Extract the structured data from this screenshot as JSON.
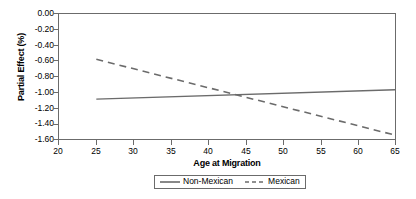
{
  "chart_data": {
    "type": "line",
    "title": "",
    "xlabel": "Age at Migration",
    "ylabel": "Partial Effect (%)",
    "xlim": [
      20,
      65
    ],
    "ylim": [
      -1.6,
      0.0
    ],
    "xticks": [
      "20",
      "25",
      "30",
      "35",
      "40",
      "45",
      "50",
      "55",
      "60",
      "65"
    ],
    "yticks": [
      "0.00",
      "-0.20",
      "-0.40",
      "-0.60",
      "-0.80",
      "-1.00",
      "-1.20",
      "-1.40",
      "-1.60"
    ],
    "grid": false,
    "legend_position": "bottom",
    "x": [
      25,
      65
    ],
    "series": [
      {
        "name": "Non-Mexican",
        "style": "solid",
        "color": "#6b6b6b",
        "values": [
          -1.09,
          -0.97
        ]
      },
      {
        "name": "Mexican",
        "style": "dashed",
        "color": "#6b6b6b",
        "values": [
          -0.58,
          -1.55
        ]
      }
    ],
    "intersection": {
      "x": 45.5,
      "y": -1.03
    }
  },
  "legend": {
    "entries": [
      {
        "label": "Non-Mexican"
      },
      {
        "label": "Mexican"
      }
    ]
  }
}
